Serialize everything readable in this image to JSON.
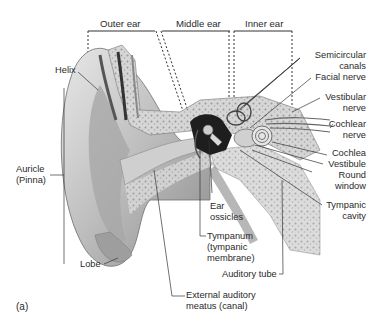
{
  "figure": {
    "panel_label": "(a)",
    "regions": {
      "outer_ear": "Outer ear",
      "middle_ear": "Middle ear",
      "inner_ear": "Inner ear"
    },
    "labels_left": {
      "helix": "Helix",
      "auricle_line1": "Auricle",
      "auricle_line2": "(Pinna)",
      "lobe": "Lobe"
    },
    "labels_bottom": {
      "ear_ossicles_line1": "Ear",
      "ear_ossicles_line2": "ossicles",
      "tympanum_line1": "Tympanum",
      "tympanum_line2": "(tympanic",
      "tympanum_line3": "membrane)",
      "auditory_tube": "Auditory tube",
      "eam_line1": "External auditory",
      "eam_line2": "meatus (canal)"
    },
    "labels_right": {
      "semicircular_line1": "Semicircular",
      "semicircular_line2": "canals",
      "facial_nerve": "Facial nerve",
      "vestibular_line1": "Vestibular",
      "vestibular_line2": "nerve",
      "cochlear_line1": "Cochlear",
      "cochlear_line2": "nerve",
      "cochlea": "Cochlea",
      "vestibule": "Vestibule",
      "round_line1": "Round",
      "round_line2": "window",
      "tympanic_line1": "Tympanic",
      "tympanic_line2": "cavity"
    }
  }
}
